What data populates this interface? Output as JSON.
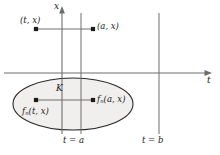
{
  "figure": {
    "title": "",
    "background": "#ffffff",
    "ink": "#1b1b1b",
    "line_color": "#6e6e6e",
    "region_fill": "#f0efee"
  },
  "axes": {
    "x_axis_label": "x",
    "t_axis_label": "t",
    "horizontal_axis_y": 73,
    "vertical_axis_x": 62
  },
  "vertical_lines": [
    {
      "name": "t = a",
      "label": "t = a",
      "x": 81
    },
    {
      "name": "t = b",
      "label": "t = b",
      "x": 159
    }
  ],
  "points": [
    {
      "name": "(t, x)",
      "label_html": "(t, x)",
      "x": 36,
      "y": 29
    },
    {
      "name": "(a, x)",
      "label_html": "(a, x)",
      "x": 93,
      "y": 29
    },
    {
      "name": "f_n(t, x)",
      "label_html": "f n (t, x)",
      "x": 36,
      "y": 100
    },
    {
      "name": "f_n(a, x)",
      "label_html": "f n (a, x)",
      "x": 93,
      "y": 100
    }
  ],
  "labels": {
    "axis_x": "x",
    "axis_t": "t",
    "point_tx": "(t, x)",
    "point_ax": "(a, x)",
    "region_k": "K",
    "fn_prefix": "f",
    "fn_subscript": "n",
    "fn_tx_args": "(t, x)",
    "fn_ax_args": "(a, x)",
    "t_eq_a": "t = a",
    "t_eq_b": "t = b"
  },
  "region": {
    "name": "K",
    "label": "K",
    "shape": "ellipse",
    "center_x": 73,
    "center_y": 104,
    "radius_x": 60,
    "radius_y": 26
  }
}
